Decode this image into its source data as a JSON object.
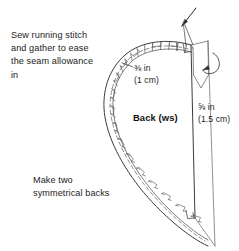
{
  "figure": {
    "type": "sewing-pattern-diagram",
    "title_fragment_top": "",
    "piece_label": "Back (ws)",
    "notes": {
      "instruction": "Sew running stitch\nand gather to ease\nthe seam allowance\nin",
      "instruction_lines": [
        "Sew running stitch",
        "and gather to ease",
        "the seam allowance",
        "in"
      ],
      "quantity": "Make two\nsymmetrical backs",
      "quantity_lines": [
        "Make two",
        "symmetrical backs"
      ]
    },
    "measurements": [
      {
        "id": "curved-seam-allowance",
        "imperial": "⅜ in",
        "metric": "(1 cm)",
        "position": "curved-edge"
      },
      {
        "id": "straight-seam-allowance",
        "imperial": "⅝ in",
        "metric": "(1.5 cm)",
        "position": "right-straight-edge"
      }
    ],
    "colors": {
      "ink": "#1a1a1a",
      "line": "#3c3c3c",
      "light_line": "#8a8a8a",
      "background": "#ffffff"
    },
    "annotations": {
      "needle_arrow": "needle-pointer",
      "fold_arrow": "roll-fold-arrow"
    }
  }
}
